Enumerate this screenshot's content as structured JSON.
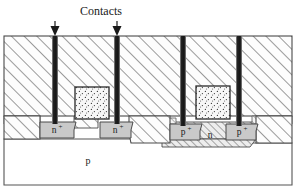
{
  "diagram": {
    "callout": {
      "label": "Contacts",
      "arrow_icon": "down-arrow-icon",
      "arrows_x": [
        55,
        117
      ],
      "text_x": 100,
      "text_y": 14
    },
    "substrate": {
      "label": "p",
      "label_x": 88,
      "label_y": 164,
      "fill": "#ffffff",
      "stroke": "#555555"
    },
    "nwell": {
      "label": "n",
      "label_x": 210,
      "label_y": 137,
      "hatch": "dense-diagonal"
    },
    "oxide": {
      "name": "field-oxide",
      "hatch": "diagonal-45",
      "fill": "#fdfdfd",
      "stroke": "#4a4a4a"
    },
    "doped_regions": [
      {
        "label": "n",
        "sup": "+",
        "x": 54,
        "y": 128,
        "type": "n-plus",
        "fill": "#c9c9c9"
      },
      {
        "label": "n",
        "sup": "+",
        "x": 116,
        "y": 128,
        "type": "n-plus",
        "fill": "#c9c9c9"
      },
      {
        "label": "p",
        "sup": "+",
        "x": 184,
        "y": 130,
        "type": "p-plus",
        "fill": "#c9c9c9"
      },
      {
        "label": "p",
        "sup": "+",
        "x": 240,
        "y": 130,
        "type": "p-plus",
        "fill": "#c9c9c9"
      }
    ],
    "contacts": [
      {
        "name": "contact-plug-1",
        "x": 52,
        "width": 6
      },
      {
        "name": "contact-plug-2",
        "x": 114,
        "width": 6
      },
      {
        "name": "contact-plug-3",
        "x": 180,
        "width": 6
      },
      {
        "name": "contact-plug-4",
        "x": 236,
        "width": 6
      }
    ],
    "gates": [
      {
        "name": "poly-gate-left",
        "x": 75,
        "y": 87,
        "width": 34,
        "height": 32,
        "fill": "stipple"
      },
      {
        "name": "poly-gate-right",
        "x": 196,
        "y": 86,
        "width": 34,
        "height": 33,
        "fill": "stipple"
      }
    ],
    "colors": {
      "contact_dark": "#1c1c1c",
      "doped_gray": "#c9c9c9",
      "outline": "#4a4a4a",
      "text": "#1a1a1a"
    }
  }
}
